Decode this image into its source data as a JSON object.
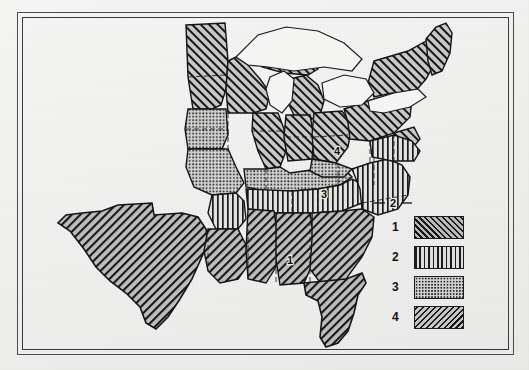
{
  "figure": {
    "type": "thematic-choropleth-map",
    "region": "Eastern and Central United States",
    "background_color": "#f2f2f0",
    "ink_color": "#1d1d1d",
    "frame": {
      "style": "double-rule",
      "color": "#3a3a3a"
    }
  },
  "legend": {
    "position": "bottom-right",
    "entries": [
      {
        "label": "1",
        "pattern": "diagonal-hatch-forward",
        "swatch_class": "sw1"
      },
      {
        "label": "2",
        "pattern": "vertical-lines",
        "swatch_class": "sw2"
      },
      {
        "label": "3",
        "pattern": "stipple-dots",
        "swatch_class": "sw3"
      },
      {
        "label": "4",
        "pattern": "diagonal-hatch-backward",
        "swatch_class": "sw4"
      }
    ]
  },
  "map_labels": [
    {
      "text": "1",
      "area": "deep-south",
      "x": 268,
      "y": 243
    },
    {
      "text": "2",
      "area": "carolinas",
      "x": 371,
      "y": 186
    },
    {
      "text": "3",
      "area": "kentucky-tennessee",
      "x": 302,
      "y": 177
    },
    {
      "text": "4",
      "area": "ohio-valley",
      "x": 315,
      "y": 134
    }
  ],
  "regions": [
    {
      "id": "1",
      "pattern": "diagonal-hatch-forward",
      "areas": [
        "Texas",
        "Louisiana",
        "Mississippi",
        "Alabama",
        "Georgia",
        "Florida"
      ]
    },
    {
      "id": "2",
      "pattern": "vertical-lines",
      "areas": [
        "Arkansas",
        "Tennessee",
        "North Carolina",
        "South Carolina",
        "Virginia"
      ]
    },
    {
      "id": "3",
      "pattern": "stipple-dots",
      "areas": [
        "Iowa",
        "Missouri",
        "Kentucky",
        "Kansas",
        "Nebraska"
      ]
    },
    {
      "id": "4",
      "pattern": "diagonal-hatch-backward",
      "areas": [
        "Minnesota",
        "Wisconsin",
        "Michigan",
        "Illinois",
        "Indiana",
        "Ohio",
        "Pennsylvania",
        "New York",
        "New England"
      ]
    }
  ],
  "water_bodies": [
    {
      "name": "Great Lakes",
      "fill": "unfilled-white"
    }
  ]
}
